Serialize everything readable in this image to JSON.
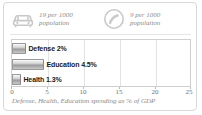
{
  "card": {
    "border_color": "#d8d8d8",
    "background": "#ffffff"
  },
  "stats": [
    {
      "icon": "car-icon",
      "value_line": "19 per 1000",
      "unit_line": "population"
    },
    {
      "icon": "telephone-circle-icon",
      "value_line": "9 per 1000",
      "unit_line": "population"
    }
  ],
  "caption": "Defense, Health, Education spending as % of GDP",
  "chart_data": {
    "type": "bar",
    "orientation": "horizontal",
    "categories": [
      "Defense",
      "Education",
      "Health"
    ],
    "values": [
      2,
      4.5,
      1.3
    ],
    "labels": [
      "Defense 2%",
      "Education 4.5%",
      "Health 1.3%"
    ],
    "title": "",
    "xlabel": "Defense, Health, Education spending as % of GDP",
    "ylabel": "",
    "xlim": [
      0,
      25
    ],
    "xticks": [
      0,
      5,
      10,
      15,
      20,
      25
    ],
    "xtick_labels": [
      "0",
      "5",
      "10",
      "15",
      "20",
      "25"
    ],
    "grid": true,
    "grid_axis": "x",
    "legend": false,
    "bar_color": "#b0b0b0",
    "grid_color": "#e3e3e3"
  }
}
